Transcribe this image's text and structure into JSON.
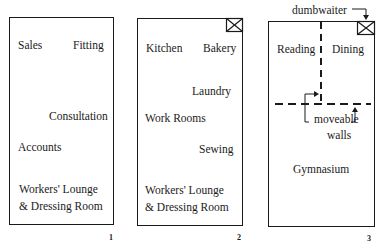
{
  "plans": [
    {
      "number": "1",
      "rooms": {
        "sales": "Sales",
        "fitting": "Fitting",
        "consultation": "Consultation",
        "accounts": "Accounts",
        "lounge_line1": "Workers' Lounge",
        "lounge_line2": "& Dressing Room"
      }
    },
    {
      "number": "2",
      "rooms": {
        "kitchen": "Kitchen",
        "bakery": "Bakery",
        "laundry": "Laundry",
        "work_rooms": "Work Rooms",
        "sewing": "Sewing",
        "lounge_line1": "Workers' Lounge",
        "lounge_line2": "& Dressing Room"
      }
    },
    {
      "number": "3",
      "rooms": {
        "reading": "Reading",
        "dining": "Dining",
        "gymnasium": "Gymnasium"
      },
      "annotations": {
        "dumbwaiter": "dumbwaiter",
        "moveable_line1": "moveable",
        "moveable_line2": "walls"
      }
    }
  ]
}
